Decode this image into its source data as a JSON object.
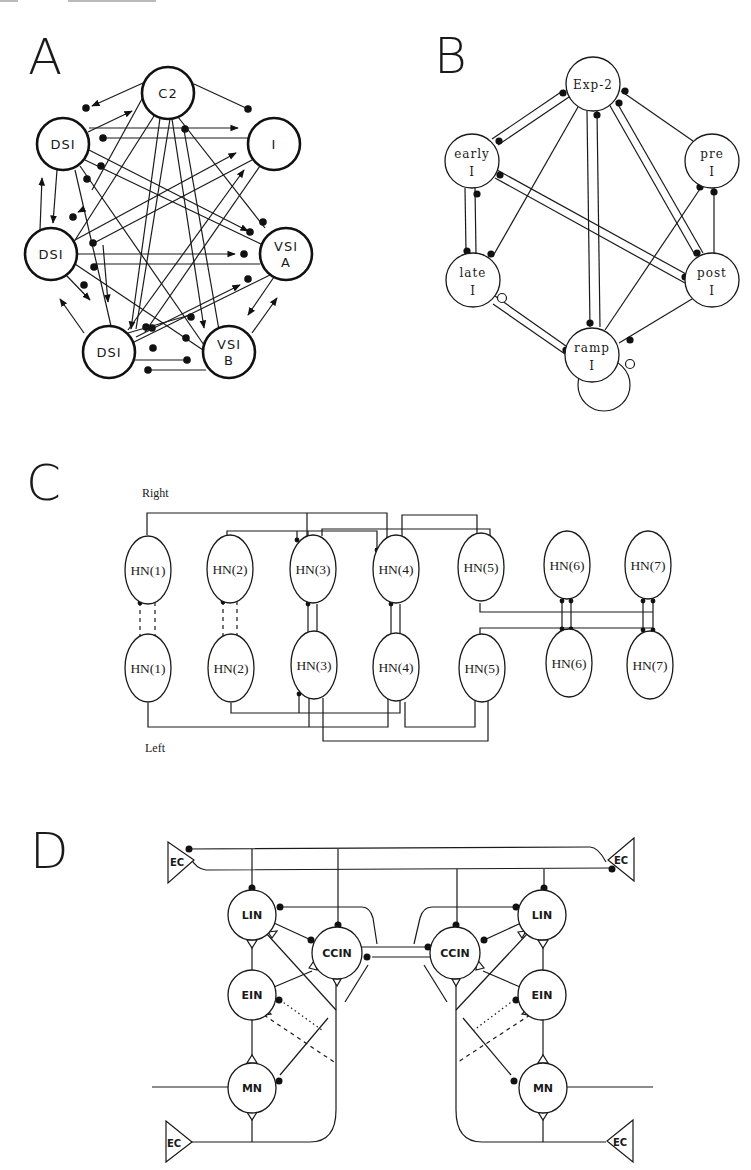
{
  "figure": {
    "header_fragment": "",
    "panels": {
      "A": {
        "letter": "A",
        "nodes": [
          {
            "id": "c2",
            "label1": "C2",
            "label2": "",
            "x": 168,
            "y": 93
          },
          {
            "id": "dsi1",
            "label1": "DSI",
            "label2": "",
            "x": 63,
            "y": 144
          },
          {
            "id": "i",
            "label1": "I",
            "label2": "",
            "x": 274,
            "y": 144
          },
          {
            "id": "dsi2",
            "label1": "DSI",
            "label2": "",
            "x": 51,
            "y": 254
          },
          {
            "id": "vsia",
            "label1": "VSI",
            "label2": "A",
            "x": 286,
            "y": 254
          },
          {
            "id": "dsi3",
            "label1": "DSI",
            "label2": "",
            "x": 109,
            "y": 352
          },
          {
            "id": "vsib",
            "label1": "VSI",
            "label2": "B",
            "x": 229,
            "y": 352
          }
        ]
      },
      "B": {
        "letter": "B",
        "nodes": [
          {
            "id": "exp2",
            "label1": "Exp-2",
            "label2": "",
            "x": 593,
            "y": 84
          },
          {
            "id": "early",
            "label1": "early",
            "label2": "I",
            "x": 472,
            "y": 161
          },
          {
            "id": "pre",
            "label1": "pre",
            "label2": "I",
            "x": 712,
            "y": 161
          },
          {
            "id": "late",
            "label1": "late",
            "label2": "I",
            "x": 473,
            "y": 280
          },
          {
            "id": "post",
            "label1": "post",
            "label2": "I",
            "x": 712,
            "y": 280
          },
          {
            "id": "ramp",
            "label1": "ramp",
            "label2": "I",
            "x": 592,
            "y": 355
          }
        ]
      },
      "C": {
        "letter": "C",
        "side_top": "Right",
        "side_bottom": "Left",
        "top_row": [
          "HN(1)",
          "HN(2)",
          "HN(3)",
          "HN(4)",
          "HN(5)",
          "HN(6)",
          "HN(7)"
        ],
        "bottom_row": [
          "HN(1)",
          "HN(2)",
          "HN(3)",
          "HN(4)",
          "HN(5)",
          "HN(6)",
          "HN(7)"
        ]
      },
      "D": {
        "letter": "D",
        "left": {
          "lin": "LIN",
          "ccin": "CCIN",
          "ein": "EIN",
          "mn": "MN",
          "ec_top": "EC",
          "ec_bottom": "EC"
        },
        "right": {
          "lin": "LIN",
          "ccin": "CCIN",
          "ein": "EIN",
          "mn": "MN",
          "ec_top": "EC",
          "ec_bottom": "EC"
        }
      }
    }
  }
}
